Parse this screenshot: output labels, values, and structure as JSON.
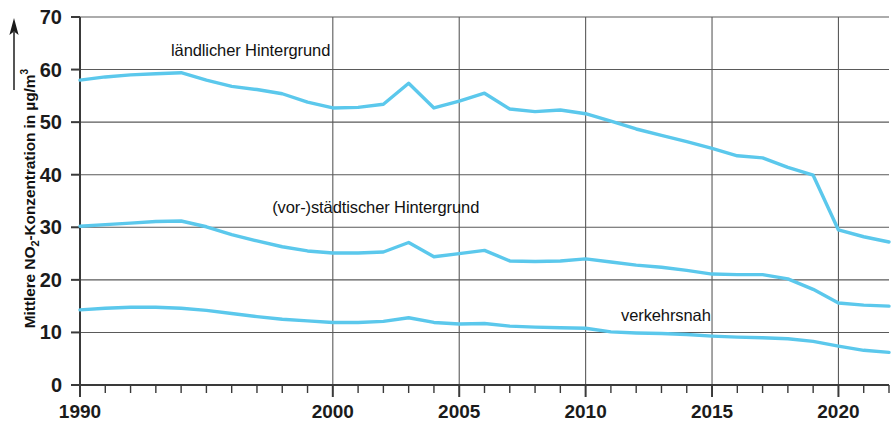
{
  "chart_data": {
    "type": "line",
    "title": "",
    "subtitle": "",
    "xlabel": "",
    "ylabel": "Mittlere NO2-Konzentration in µg/m3",
    "ylabel_parts": {
      "pre": "Mittlere NO",
      "sub": "2",
      "mid": "-Konzentration in µg/m",
      "sup": "3"
    },
    "xlim": [
      1990,
      2022
    ],
    "ylim": [
      0,
      70
    ],
    "grid": true,
    "legend_position": "inline-annotations",
    "y_ticks": [
      0,
      10,
      20,
      30,
      40,
      50,
      60,
      70
    ],
    "y_tick_labels": [
      "0",
      "10",
      "20",
      "30",
      "40",
      "50",
      "60",
      "70"
    ],
    "x_ticks_major": [
      1990,
      2000,
      2005,
      2010,
      2015,
      2020
    ],
    "x_tick_labels": [
      "1990",
      "2000",
      "2005",
      "2010",
      "2015",
      "2020"
    ],
    "x_minor_tick_step": 1,
    "line_color": "#5BC8EC",
    "axis_color": "#3a3a3a",
    "grid_color": "#5a5a5a",
    "x": [
      1990,
      1991,
      1992,
      1993,
      1994,
      1995,
      1996,
      1997,
      1998,
      1999,
      2000,
      2001,
      2002,
      2003,
      2004,
      2005,
      2006,
      2007,
      2008,
      2009,
      2010,
      2011,
      2012,
      2013,
      2014,
      2015,
      2016,
      2017,
      2018,
      2019,
      2020,
      2021,
      2022
    ],
    "series": [
      {
        "name": "verkehrsnah",
        "label": "verkehrsnah",
        "label_position": {
          "x": 2011.4,
          "y": 13.2
        },
        "color": "#5BC8EC",
        "values": [
          58.0,
          58.6,
          59.0,
          59.2,
          59.4,
          58.0,
          56.8,
          56.2,
          55.4,
          53.8,
          52.7,
          52.8,
          53.4,
          57.4,
          52.7,
          54.0,
          55.5,
          52.5,
          52.0,
          52.3,
          51.6,
          50.2,
          48.7,
          47.5,
          46.3,
          45.0,
          43.6,
          43.2,
          41.4,
          39.9,
          29.5,
          28.2,
          27.2
        ]
      },
      {
        "name": "vor-staedtischer-hintergrund",
        "label": "(vor-)städtischer Hintergrund",
        "label_position": {
          "x": 1997.6,
          "y": 33.6
        },
        "color": "#5BC8EC",
        "values": [
          30.2,
          30.5,
          30.8,
          31.1,
          31.2,
          30.1,
          28.6,
          27.4,
          26.3,
          25.5,
          25.1,
          25.1,
          25.3,
          27.1,
          24.4,
          25.0,
          25.6,
          23.6,
          23.5,
          23.6,
          24.0,
          23.4,
          22.8,
          22.4,
          21.8,
          21.1,
          21.0,
          21.0,
          20.2,
          18.2,
          15.6,
          15.2,
          15.0
        ]
      },
      {
        "name": "laendlicher-hintergrund",
        "label": "ländlicher Hintergrund",
        "label_position": {
          "x": 1993.6,
          "y": 63.6
        },
        "color": "#5BC8EC",
        "values": [
          14.3,
          14.6,
          14.8,
          14.8,
          14.6,
          14.2,
          13.6,
          13.0,
          12.5,
          12.2,
          11.9,
          11.9,
          12.1,
          12.8,
          11.9,
          11.6,
          11.7,
          11.2,
          11.0,
          10.9,
          10.8,
          10.1,
          9.9,
          9.8,
          9.6,
          9.3,
          9.1,
          9.0,
          8.8,
          8.3,
          7.4,
          6.6,
          6.2
        ]
      }
    ]
  }
}
